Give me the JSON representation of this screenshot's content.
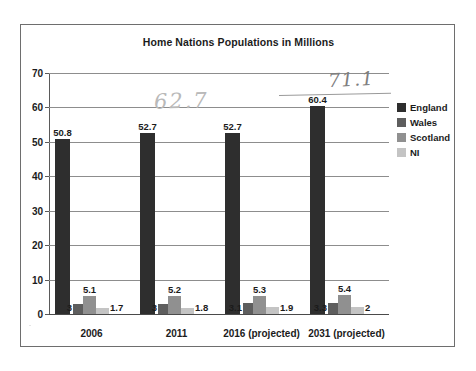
{
  "chart_data": {
    "type": "bar",
    "title": "Home Nations Populations in Millions",
    "xlabel": "",
    "ylabel": "",
    "ylim": [
      0,
      70
    ],
    "yticks": [
      0,
      10,
      20,
      30,
      40,
      50,
      60,
      70
    ],
    "grid": true,
    "legend_position": "right",
    "categories": [
      "2006",
      "2011",
      "2016 (projected)",
      "2031 (projected)"
    ],
    "series": [
      {
        "name": "England",
        "color": "#2e2e2e",
        "values": [
          50.8,
          52.7,
          52.7,
          60.4
        ],
        "labels": [
          "50.8",
          "52.7",
          "52.7",
          "60.4"
        ]
      },
      {
        "name": "Wales",
        "color": "#5e5e5e",
        "values": [
          3,
          3,
          3.1,
          3.3
        ],
        "labels": [
          "3",
          "3",
          "3.1",
          "3.3"
        ]
      },
      {
        "name": "Scotland",
        "color": "#909090",
        "values": [
          5.1,
          5.2,
          5.3,
          5.4
        ],
        "labels": [
          "5.1",
          "5.2",
          "5.3",
          "5.4"
        ]
      },
      {
        "name": "NI",
        "color": "#c4c4c4",
        "values": [
          1.7,
          1.8,
          1.9,
          2
        ],
        "labels": [
          "1.7",
          "1.8",
          "1.9",
          "2"
        ]
      }
    ],
    "annotations": [
      {
        "id": "annotation-62",
        "text": "62.7",
        "style": "handwritten-pencil-light"
      },
      {
        "id": "annotation-71",
        "text": "71.1",
        "style": "handwritten-pencil-dark"
      }
    ]
  },
  "legend": {
    "items": [
      {
        "label": "England",
        "color": "#2e2e2e"
      },
      {
        "label": "Wales",
        "color": "#5e5e5e"
      },
      {
        "label": "Scotland",
        "color": "#909090"
      },
      {
        "label": "NI",
        "color": "#c4c4c4"
      }
    ]
  }
}
